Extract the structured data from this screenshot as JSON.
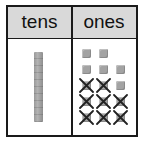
{
  "headers": {
    "tens": "tens",
    "ones": "ones"
  },
  "tens": {
    "rods": 1
  },
  "ones": {
    "rows": [
      [
        "cube",
        "cube",
        null
      ],
      [
        "cube",
        "cube",
        "cube"
      ],
      [
        "crossed",
        "crossed",
        "cube"
      ],
      [
        "crossed",
        "crossed",
        "crossed"
      ],
      [
        "crossed",
        "crossed",
        "crossed"
      ]
    ],
    "total_cubes": 14,
    "crossed_out": 8,
    "remaining": 6
  },
  "colors": {
    "header_bg": "#d9d9d9",
    "block": "#a3a3a3",
    "border": "#1a1a1a"
  }
}
